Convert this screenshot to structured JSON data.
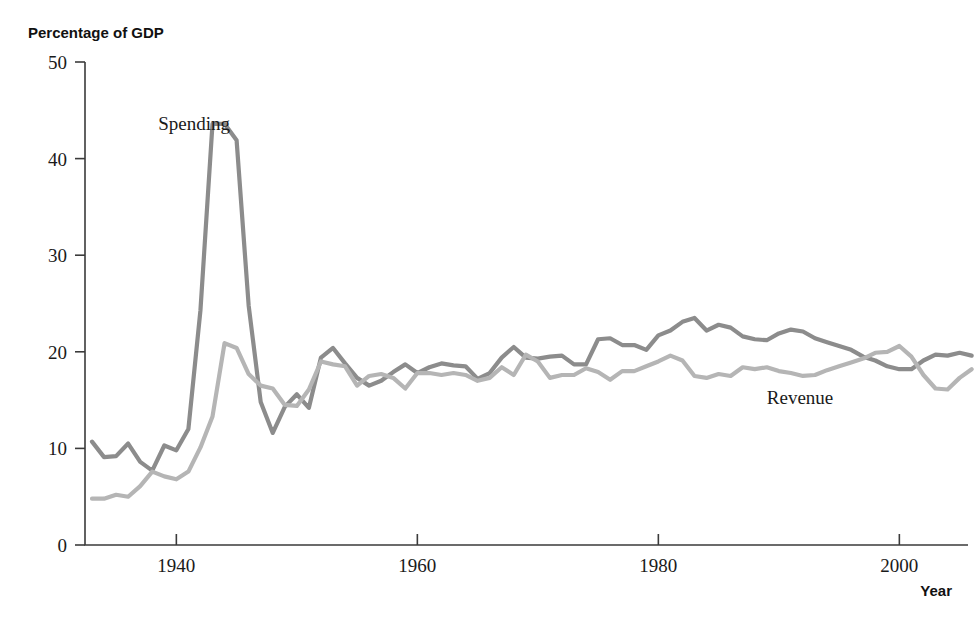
{
  "chart_data": {
    "type": "line",
    "title": "",
    "ylabel": "Percentage of GDP",
    "xlabel": "Year",
    "xlim": [
      1933,
      2006
    ],
    "ylim": [
      0,
      50
    ],
    "yticks": [
      0,
      10,
      20,
      30,
      40,
      50
    ],
    "xticks": [
      1940,
      1960,
      1980,
      2000
    ],
    "grid": false,
    "legend_position": "inline-annotations",
    "colors": {
      "spending": "#8c8c8c",
      "revenue": "#b5b5b5",
      "axis": "#3b3b3b",
      "text": "#1a1a1a",
      "background": "#ffffff"
    },
    "annotations": [
      {
        "text": "Spending",
        "x": 1938.5,
        "y": 43.0
      },
      {
        "text": "Revenue",
        "x": 1989.0,
        "y": 14.6
      }
    ],
    "x": [
      1933,
      1934,
      1935,
      1936,
      1937,
      1938,
      1939,
      1940,
      1941,
      1942,
      1943,
      1944,
      1945,
      1946,
      1947,
      1948,
      1949,
      1950,
      1951,
      1952,
      1953,
      1954,
      1955,
      1956,
      1957,
      1958,
      1959,
      1960,
      1961,
      1962,
      1963,
      1964,
      1965,
      1966,
      1967,
      1968,
      1969,
      1970,
      1971,
      1972,
      1973,
      1974,
      1975,
      1976,
      1977,
      1978,
      1979,
      1980,
      1981,
      1982,
      1983,
      1984,
      1985,
      1986,
      1987,
      1988,
      1989,
      1990,
      1991,
      1992,
      1993,
      1994,
      1995,
      1996,
      1997,
      1998,
      1999,
      2000,
      2001,
      2002,
      2003,
      2004,
      2005,
      2006
    ],
    "series": [
      {
        "name": "Spending",
        "color": "#8c8c8c",
        "values": [
          10.7,
          9.1,
          9.2,
          10.5,
          8.6,
          7.7,
          10.3,
          9.8,
          12.0,
          24.3,
          43.6,
          43.6,
          41.9,
          24.8,
          14.8,
          11.6,
          14.3,
          15.6,
          14.2,
          19.4,
          20.4,
          18.8,
          17.3,
          16.5,
          17.0,
          17.9,
          18.7,
          17.8,
          18.4,
          18.8,
          18.6,
          18.5,
          17.2,
          17.8,
          19.4,
          20.5,
          19.4,
          19.3,
          19.5,
          19.6,
          18.7,
          18.7,
          21.3,
          21.4,
          20.7,
          20.7,
          20.2,
          21.7,
          22.2,
          23.1,
          23.5,
          22.2,
          22.8,
          22.5,
          21.6,
          21.3,
          21.2,
          21.9,
          22.3,
          22.1,
          21.4,
          21.0,
          20.6,
          20.2,
          19.5,
          19.1,
          18.5,
          18.2,
          18.2,
          19.1,
          19.7,
          19.6,
          19.9,
          19.6
        ]
      },
      {
        "name": "Revenue",
        "color": "#b5b5b5",
        "values": [
          4.8,
          4.8,
          5.2,
          5.0,
          6.1,
          7.6,
          7.1,
          6.8,
          7.6,
          10.1,
          13.3,
          20.9,
          20.4,
          17.7,
          16.5,
          16.2,
          14.5,
          14.4,
          16.1,
          19.0,
          18.7,
          18.5,
          16.5,
          17.5,
          17.7,
          17.3,
          16.2,
          17.8,
          17.8,
          17.6,
          17.8,
          17.6,
          17.0,
          17.3,
          18.4,
          17.6,
          19.7,
          19.0,
          17.3,
          17.6,
          17.6,
          18.3,
          17.9,
          17.1,
          18.0,
          18.0,
          18.5,
          19.0,
          19.6,
          19.1,
          17.5,
          17.3,
          17.7,
          17.5,
          18.4,
          18.2,
          18.4,
          18.0,
          17.8,
          17.5,
          17.6,
          18.1,
          18.5,
          18.9,
          19.3,
          19.9,
          20.0,
          20.6,
          19.5,
          17.6,
          16.2,
          16.1,
          17.3,
          18.2
        ]
      }
    ]
  },
  "axes": {
    "y_axis_title": "Percentage of GDP",
    "x_axis_title": "Year",
    "y_tick_labels": [
      "50",
      "40",
      "30",
      "20",
      "10",
      "0"
    ],
    "x_tick_labels": [
      "1940",
      "1960",
      "1980",
      "2000"
    ]
  },
  "labels": {
    "spending": "Spending",
    "revenue": "Revenue"
  }
}
